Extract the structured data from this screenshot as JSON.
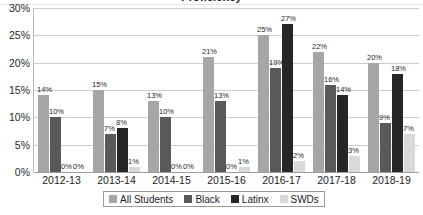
{
  "chart_data": {
    "type": "bar",
    "title": "Proficiency",
    "xlabel": "",
    "ylabel": "",
    "ylim": [
      0,
      30
    ],
    "ytick_labels": [
      "30%",
      "25%",
      "20%",
      "15%",
      "10%",
      "5%",
      "0%"
    ],
    "ytick_values": [
      30,
      25,
      20,
      15,
      10,
      5,
      0
    ],
    "grid": true,
    "legend_position": "bottom",
    "categories": [
      "2012-13",
      "2013-14",
      "2014-15",
      "2015-16",
      "2016-17",
      "2017-18",
      "2018-19"
    ],
    "series": [
      {
        "name": "All Students",
        "color": "#a6a6a6",
        "values": [
          14,
          15,
          13,
          21,
          25,
          22,
          20
        ],
        "labels": [
          "14%",
          "15%",
          "13%",
          "21%",
          "25%",
          "22%",
          "20%"
        ]
      },
      {
        "name": "Black",
        "color": "#595959",
        "values": [
          10,
          7,
          10,
          13,
          19,
          16,
          9
        ],
        "labels": [
          "10%",
          "7%",
          "10%",
          "13%",
          "19%",
          "16%",
          "9%"
        ]
      },
      {
        "name": "Latinx",
        "color": "#262626",
        "values": [
          0,
          8,
          0,
          0,
          27,
          14,
          18
        ],
        "labels": [
          "0%",
          "8%",
          "0%",
          "0%",
          "27%",
          "14%",
          "18%"
        ]
      },
      {
        "name": "SWDs",
        "color": "#d9d9d9",
        "values": [
          0,
          1,
          0,
          1,
          2,
          3,
          7
        ],
        "labels": [
          "0%",
          "1%",
          "0%",
          "1%",
          "2%",
          "3%",
          "7%"
        ]
      }
    ]
  },
  "legend": {
    "items": [
      {
        "label": "All Students",
        "color": "#a6a6a6"
      },
      {
        "label": "Black",
        "color": "#595959"
      },
      {
        "label": "Latinx",
        "color": "#262626"
      },
      {
        "label": "SWDs",
        "color": "#d9d9d9"
      }
    ]
  }
}
